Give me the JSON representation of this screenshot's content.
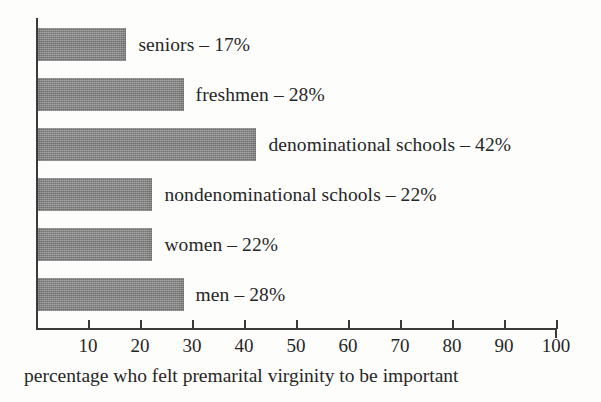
{
  "chart_data": {
    "type": "bar",
    "orientation": "horizontal",
    "title": "",
    "subtitle": "",
    "xlabel": "percentage who felt premarital virginity to be important",
    "ylabel": "",
    "xlim": [
      0,
      100
    ],
    "grid": false,
    "legend": null,
    "categories": [
      "seniors",
      "freshmen",
      "denominational schools",
      "nondenominational schools",
      "women",
      "men"
    ],
    "values": [
      17,
      28,
      42,
      22,
      22,
      28
    ],
    "bar_labels": [
      "seniors – 17%",
      "freshmen – 28%",
      "denominational schools – 42%",
      "nondenominational schools – 22%",
      "women – 22%",
      "men – 28%"
    ],
    "xticks": [
      10,
      20,
      30,
      40,
      50,
      60,
      70,
      80,
      90,
      100
    ],
    "xtick_labels": [
      "10",
      "20",
      "30",
      "40",
      "50",
      "60",
      "70",
      "80",
      "90",
      "100"
    ],
    "colors": {
      "bar_fill": "#8c8c8c",
      "axis": "#3a3a3a",
      "text": "#262626",
      "background": "#fdfdfc"
    }
  },
  "caption": {
    "text": "percentage who felt premarital virginity to be important"
  }
}
